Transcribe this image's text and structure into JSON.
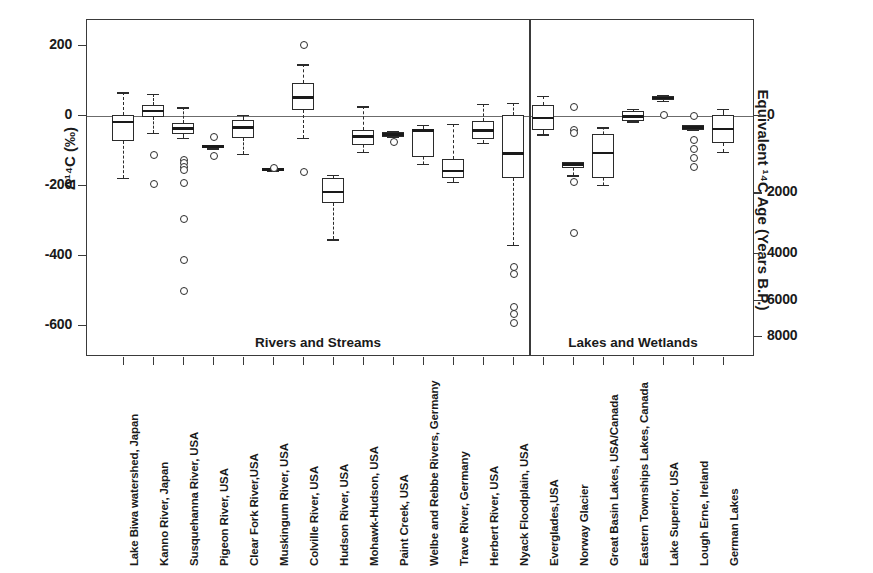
{
  "figure": {
    "y_axis_left": {
      "title": "Δ¹⁴C (‰)",
      "ticks": [
        200,
        0,
        -200,
        -400,
        -600
      ],
      "tick_labels": [
        "200",
        "0",
        "-200",
        "-400",
        "-600"
      ],
      "min": -700,
      "max": 265
    },
    "y_axis_right": {
      "title": "Equivalent ¹⁴C Age (Years B.P.)",
      "ticks": [
        0,
        2000,
        4000,
        6000,
        8000
      ],
      "tick_labels": [
        "0",
        "2000",
        "4000",
        "6000",
        "8000"
      ],
      "tick_delta14c": [
        0,
        -221,
        -393,
        -528,
        -632
      ]
    },
    "groups": [
      {
        "label": "Rivers and Streams",
        "start_index": 0,
        "end_index": 13
      },
      {
        "label": "Lakes and Wetlands",
        "start_index": 14,
        "end_index": 20
      }
    ],
    "zero_reference_line": 0,
    "divider_after_index": 13
  },
  "chart_data": {
    "type": "box",
    "title": "",
    "xlabel": "",
    "ylabel": "Δ¹⁴C (‰)",
    "ylabel_secondary": "Equivalent ¹⁴C Age (Years B.P.)",
    "ylim": [
      -700,
      265
    ],
    "grid": false,
    "legend": "none",
    "categories": [
      "Lake Biwa watershed, Japan",
      "Kanno River, Japan",
      "Susquehanna River, USA",
      "Pigeon River, USA",
      "Clear Fork River,USA",
      "Muskingum River, USA",
      "Colville River, USA",
      "Hudson River, USA",
      "Mohawk-Hudson, USA",
      "Paint Creek, USA",
      "Welbe and Rebbe Rivers, Germany",
      "Trave River, Germany",
      "Herbert River, USA",
      "Nyack Floodplain, USA",
      "Everglades,USA",
      "Norway Glacier",
      "Great Basin Lakes, USA/Canada",
      "Eastern Townships Lakes, Canada",
      "Lake Superior, USA",
      "Lough Erne, Ireland",
      "German Lakes"
    ],
    "boxes": [
      {
        "name": "Lake Biwa watershed, Japan",
        "whisker_low": -180,
        "q1": -75,
        "median": -20,
        "q3": 0,
        "whisker_high": 65,
        "outliers": []
      },
      {
        "name": "Kanno River, Japan",
        "whisker_low": -50,
        "q1": -5,
        "median": 12,
        "q3": 28,
        "whisker_high": 60,
        "outliers": [
          -110,
          -195
        ]
      },
      {
        "name": "Susquehanna River, USA",
        "whisker_low": -65,
        "q1": -55,
        "median": -38,
        "q3": -22,
        "whisker_high": 22,
        "outliers": [
          -125,
          -135,
          -145,
          -155,
          -190,
          -295,
          -410,
          -500
        ]
      },
      {
        "name": "Pigeon River, USA",
        "whisker_low": -95,
        "q1": -95,
        "median": -90,
        "q3": -85,
        "whisker_high": -85,
        "outliers": [
          -60,
          -115
        ]
      },
      {
        "name": "Clear Fork River,USA",
        "whisker_low": -110,
        "q1": -65,
        "median": -35,
        "q3": -15,
        "whisker_high": 0,
        "outliers": []
      },
      {
        "name": "Muskingum River, USA",
        "whisker_low": -158,
        "q1": -158,
        "median": -155,
        "q3": -152,
        "whisker_high": -150,
        "outliers": [
          -148
        ]
      },
      {
        "name": "Colville River, USA",
        "whisker_low": -65,
        "q1": 15,
        "median": 50,
        "q3": 92,
        "whisker_high": 145,
        "outliers": [
          203,
          -160
        ]
      },
      {
        "name": "Hudson River, USA",
        "whisker_low": -355,
        "q1": -250,
        "median": -220,
        "q3": -180,
        "whisker_high": -170,
        "outliers": []
      },
      {
        "name": "Mohawk-Hudson, USA",
        "whisker_low": -105,
        "q1": -85,
        "median": -62,
        "q3": -42,
        "whisker_high": 25,
        "outliers": []
      },
      {
        "name": "Paint Creek, USA",
        "whisker_low": -62,
        "q1": -62,
        "median": -55,
        "q3": -48,
        "whisker_high": -45,
        "outliers": [
          -75
        ]
      },
      {
        "name": "Welbe and Rebbe Rivers, Germany",
        "whisker_low": -140,
        "q1": -120,
        "median": -45,
        "q3": -42,
        "whisker_high": -28,
        "outliers": []
      },
      {
        "name": "Trave River, Germany",
        "whisker_low": -190,
        "q1": -180,
        "median": -160,
        "q3": -125,
        "whisker_high": -25,
        "outliers": []
      },
      {
        "name": "Herbert River, USA",
        "whisker_low": -80,
        "q1": -70,
        "median": -45,
        "q3": -18,
        "whisker_high": 32,
        "outliers": []
      },
      {
        "name": "Nyack Floodplain, USA",
        "whisker_low": -370,
        "q1": -180,
        "median": -110,
        "q3": 0,
        "whisker_high": 35,
        "outliers": [
          -430,
          -450,
          -545,
          -565,
          -590
        ]
      },
      {
        "name": "Everglades,USA",
        "whisker_low": -55,
        "q1": -42,
        "median": -8,
        "q3": 30,
        "whisker_high": 55,
        "outliers": []
      },
      {
        "name": "Norway Glacier",
        "whisker_low": -172,
        "q1": -150,
        "median": -142,
        "q3": -135,
        "whisker_high": -135,
        "outliers": [
          25,
          -40,
          -48,
          -188,
          -335
        ]
      },
      {
        "name": "Great Basin Lakes, USA/Canada",
        "whisker_low": -200,
        "q1": -180,
        "median": -108,
        "q3": -55,
        "whisker_high": -35,
        "outliers": []
      },
      {
        "name": "Eastern Townships Lakes, Canada",
        "whisker_low": -18,
        "q1": -18,
        "median": -5,
        "q3": 12,
        "whisker_high": 18,
        "outliers": []
      },
      {
        "name": "Lake Superior, USA",
        "whisker_low": 40,
        "q1": 42,
        "median": 48,
        "q3": 55,
        "whisker_high": 58,
        "outliers": [
          2
        ]
      },
      {
        "name": "Lough Erne, Ireland",
        "whisker_low": -42,
        "q1": -42,
        "median": -35,
        "q3": -28,
        "whisker_high": -28,
        "outliers": [
          0,
          -68,
          -95,
          -120,
          -145
        ]
      },
      {
        "name": "German Lakes",
        "whisker_low": -105,
        "q1": -80,
        "median": -40,
        "q3": 0,
        "whisker_high": 18,
        "outliers": []
      }
    ]
  }
}
